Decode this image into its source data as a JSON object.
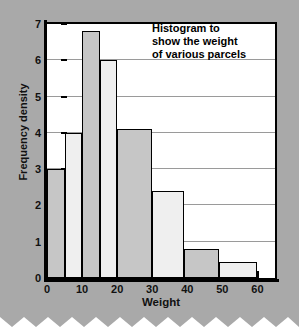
{
  "chart_data": {
    "type": "bar",
    "title": "Histogram to show the weight of various parcels",
    "title_lines": [
      "Histogram to",
      "show the weight",
      "of various parcels"
    ],
    "xlabel": "Weight",
    "ylabel": "Frequency density",
    "xlim": [
      0,
      65
    ],
    "ylim": [
      0,
      7
    ],
    "xticks": [
      0,
      10,
      20,
      30,
      40,
      50,
      60
    ],
    "yticks": [
      0,
      1,
      2,
      3,
      4,
      5,
      6,
      7
    ],
    "grid": "horizontal",
    "legend": "none",
    "bins": [
      {
        "label": "0-5",
        "x0": 0,
        "x1": 5,
        "value": 3.0,
        "shade": "dark"
      },
      {
        "label": "5-10",
        "x0": 5,
        "x1": 10,
        "value": 4.0,
        "shade": "light"
      },
      {
        "label": "10-15",
        "x0": 10,
        "x1": 15,
        "value": 6.8,
        "shade": "dark"
      },
      {
        "label": "15-20",
        "x0": 15,
        "x1": 20,
        "value": 6.0,
        "shade": "light"
      },
      {
        "label": "20-30",
        "x0": 20,
        "x1": 30,
        "value": 4.1,
        "shade": "dark"
      },
      {
        "label": "30-39",
        "x0": 30,
        "x1": 39,
        "value": 2.4,
        "shade": "light"
      },
      {
        "label": "39-49",
        "x0": 39,
        "x1": 49,
        "value": 0.8,
        "shade": "dark"
      },
      {
        "label": "49-60",
        "x0": 49,
        "x1": 60,
        "value": 0.45,
        "shade": "light"
      }
    ],
    "colors": {
      "bar_dark": "#c6c6c6",
      "bar_light": "#efefef",
      "outline": "#000000",
      "grid": "#9a9a9a",
      "plot_background": "#ffffff",
      "page_background": "#a9a9a9"
    }
  }
}
